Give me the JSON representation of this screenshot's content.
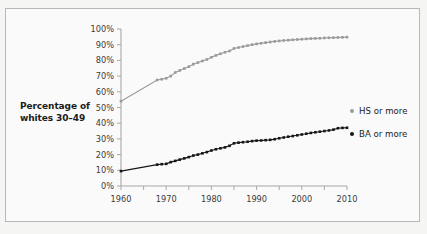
{
  "ylabel_lines": [
    "Percentage of",
    "whites 30–49"
  ],
  "legend": {
    "position": "right",
    "items": [
      {
        "label": "HS or more",
        "color": "#9a9a9a",
        "marker": "dot"
      },
      {
        "label": "BA or more",
        "color": "#161616",
        "marker": "dot"
      }
    ]
  },
  "chart_data": {
    "type": "line",
    "title": "",
    "xlabel": "",
    "ylabel": "Percentage of whites 30–49",
    "xlim": [
      1960,
      2010
    ],
    "ylim": [
      0,
      100
    ],
    "grid": false,
    "xticks": [
      1960,
      1970,
      1980,
      1990,
      2000,
      2010
    ],
    "xtick_labels": [
      "1960",
      "1970",
      "1980",
      "1990",
      "2000",
      "2010"
    ],
    "xminor_step": 5,
    "yticks": [
      0,
      10,
      20,
      30,
      40,
      50,
      60,
      70,
      80,
      90,
      100
    ],
    "ytick_labels": [
      "0%",
      "10%",
      "20%",
      "30%",
      "40%",
      "50%",
      "60%",
      "70%",
      "80%",
      "90%",
      "100%"
    ],
    "series": [
      {
        "name": "HS or more",
        "color": "#9a9a9a",
        "x": [
          1960,
          1968,
          1969,
          1970,
          1971,
          1972,
          1973,
          1974,
          1975,
          1976,
          1977,
          1978,
          1979,
          1980,
          1981,
          1982,
          1983,
          1984,
          1985,
          1986,
          1987,
          1988,
          1989,
          1990,
          1991,
          1992,
          1993,
          1994,
          1995,
          1996,
          1997,
          1998,
          1999,
          2000,
          2001,
          2002,
          2003,
          2004,
          2005,
          2006,
          2007,
          2008,
          2009,
          2010
        ],
        "values": [
          54.0,
          67.5,
          68.0,
          68.6,
          70.0,
          72.3,
          73.6,
          74.8,
          76.0,
          77.6,
          78.6,
          79.6,
          80.6,
          82.0,
          83.2,
          84.2,
          85.2,
          86.0,
          87.6,
          88.2,
          88.8,
          89.4,
          90.0,
          90.5,
          90.9,
          91.3,
          91.7,
          92.1,
          92.4,
          92.7,
          92.9,
          93.1,
          93.3,
          93.5,
          93.7,
          93.9,
          94.0,
          94.1,
          94.3,
          94.4,
          94.5,
          94.6,
          94.7,
          94.8
        ]
      },
      {
        "name": "BA or more",
        "color": "#161616",
        "x": [
          1960,
          1968,
          1969,
          1970,
          1971,
          1972,
          1973,
          1974,
          1975,
          1976,
          1977,
          1978,
          1979,
          1980,
          1981,
          1982,
          1983,
          1984,
          1985,
          1986,
          1987,
          1988,
          1989,
          1990,
          1991,
          1992,
          1993,
          1994,
          1995,
          1996,
          1997,
          1998,
          1999,
          2000,
          2001,
          2002,
          2003,
          2004,
          2005,
          2006,
          2007,
          2008,
          2009,
          2010
        ],
        "values": [
          9.5,
          13.6,
          13.9,
          14.1,
          15.2,
          16.0,
          16.8,
          17.6,
          18.4,
          19.4,
          20.0,
          20.8,
          21.6,
          22.6,
          23.4,
          24.0,
          24.6,
          25.6,
          27.2,
          27.6,
          27.9,
          28.2,
          28.6,
          28.9,
          29.0,
          29.2,
          29.4,
          29.8,
          30.4,
          30.9,
          31.4,
          31.8,
          32.3,
          32.8,
          33.3,
          33.8,
          34.2,
          34.6,
          35.0,
          35.4,
          35.9,
          36.8,
          37.0,
          37.1
        ]
      }
    ]
  }
}
